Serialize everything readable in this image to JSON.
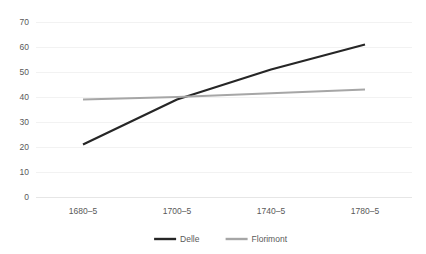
{
  "chart_data": {
    "type": "line",
    "title": "",
    "subtitle": "",
    "xlabel": "",
    "ylabel": "",
    "categories": [
      "1680–5",
      "1700–5",
      "1740–5",
      "1780–5"
    ],
    "series": [
      {
        "name": "Delle",
        "values": [
          21,
          39,
          51,
          61
        ],
        "color": "#262626"
      },
      {
        "name": "Florimont",
        "values": [
          39,
          40,
          41.5,
          43
        ],
        "color": "#a6a6a6"
      }
    ],
    "ylim": [
      0,
      70
    ],
    "ytick_values": [
      0,
      10,
      20,
      30,
      40,
      50,
      60,
      70
    ],
    "ytick_labels": [
      "0",
      "10",
      "20",
      "30",
      "40",
      "50",
      "60",
      "70"
    ],
    "grid": true,
    "grid_axis": "y",
    "legend_position": "bottom"
  },
  "legend": {
    "entries": [
      {
        "label": "Delle",
        "color": "#262626"
      },
      {
        "label": "Florimont",
        "color": "#a6a6a6"
      }
    ]
  },
  "colors": {
    "background": "#ffffff",
    "gridline": "#f2f2f2",
    "axisline": "#e6e6e6",
    "tick_text": "#595959",
    "series_delle": "#262626",
    "series_florimont": "#a6a6a6"
  }
}
